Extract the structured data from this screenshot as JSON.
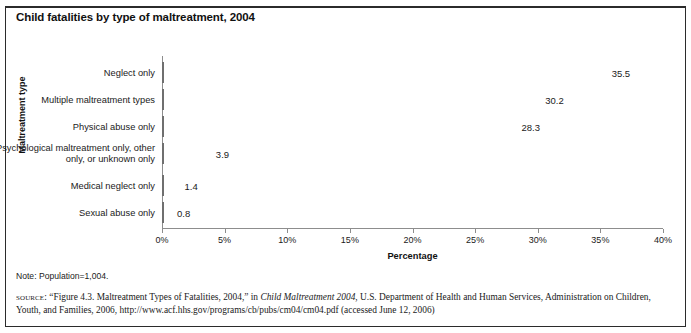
{
  "figure": {
    "title": "Child fatalities by type of maltreatment, 2004",
    "note": "Note: Population=1,004.",
    "source_label": "source:",
    "source_part1": "“Figure 4.3. Maltreatment Types of Fatalities, 2004,” in ",
    "source_italic1": "Child Maltreatment 2004",
    "source_part2": ", U.S. Department of Health and Human Services, Administration on Children, Youth, and Families, 2006, http://www.acf.hhs.gov/programs/cb/pubs/cm04/cm04.pdf (accessed June 12, 2006)"
  },
  "chart_data": {
    "type": "bar",
    "orientation": "horizontal",
    "title": "Child fatalities by type of maltreatment, 2004",
    "xlabel": "Percentage",
    "ylabel": "Maltreatment type",
    "xlim": [
      0,
      40
    ],
    "xticks": [
      "0%",
      "5%",
      "10%",
      "15%",
      "20%",
      "25%",
      "30%",
      "35%",
      "40%"
    ],
    "xtick_values": [
      0,
      5,
      10,
      15,
      20,
      25,
      30,
      35,
      40
    ],
    "grid": false,
    "legend": "none",
    "bar_color": "#a8a8a8",
    "bar_edge_color": "#6f6f6f",
    "categories": [
      "Neglect only",
      "Multiple maltreatment types",
      "Physical abuse only",
      "Psychological maltreatment only, other only, or unknown only",
      "Medical neglect only",
      "Sexual abuse only"
    ],
    "values": [
      35.5,
      30.2,
      28.3,
      3.9,
      1.4,
      0.8
    ],
    "value_labels": [
      "35.5",
      "30.2",
      "28.3",
      "3.9",
      "1.4",
      "0.8"
    ]
  }
}
